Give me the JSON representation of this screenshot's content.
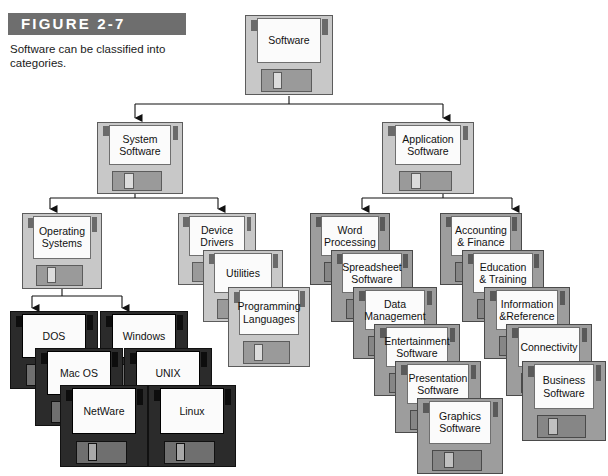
{
  "figure": {
    "header_label": "FIGURE 2-7",
    "caption": "Software can be classified into categories.",
    "header_color": "#6e6e6e"
  },
  "diagram": {
    "root": {
      "label": "Software",
      "style": "light"
    },
    "level2": [
      {
        "label": "System\nSoftware",
        "style": "light"
      },
      {
        "label": "Application\nSoftware",
        "style": "light"
      }
    ],
    "system_children": [
      {
        "label": "Operating\nSystems",
        "style": "light"
      },
      {
        "label": "Device\nDrivers",
        "style": "light"
      },
      {
        "label": "Utilities",
        "style": "light"
      },
      {
        "label": "Programming\nLanguages",
        "style": "light"
      }
    ],
    "operating_systems": {
      "left_stack": [
        {
          "label": "DOS",
          "style": "dark"
        },
        {
          "label": "Mac OS",
          "style": "dark"
        },
        {
          "label": "NetWare",
          "style": "dark"
        }
      ],
      "right_stack": [
        {
          "label": "Windows",
          "style": "dark"
        },
        {
          "label": "UNIX",
          "style": "dark"
        },
        {
          "label": "Linux",
          "style": "dark"
        }
      ]
    },
    "application_left_stack": [
      {
        "label": "Word\nProcessing",
        "style": "gray"
      },
      {
        "label": "Spreadsheet\nSoftware",
        "style": "gray"
      },
      {
        "label": "Data\nManagement",
        "style": "gray"
      },
      {
        "label": "Entertainment\nSoftware",
        "style": "gray"
      },
      {
        "label": "Presentation\nSoftware",
        "style": "gray"
      },
      {
        "label": "Graphics\nSoftware",
        "style": "gray"
      }
    ],
    "application_right_stack": [
      {
        "label": "Accounting\n& Finance",
        "style": "gray"
      },
      {
        "label": "Education\n& Training",
        "style": "gray"
      },
      {
        "label": "Information\n&Reference",
        "style": "gray"
      },
      {
        "label": "Connectivity",
        "style": "gray"
      },
      {
        "label": "Business\nSoftware",
        "style": "gray"
      }
    ]
  },
  "labels": {
    "root": "Software",
    "system_software": "System Software",
    "application_software": "Application Software",
    "operating_systems": "Operating Systems",
    "device_drivers": "Device Drivers",
    "utilities": "Utilities",
    "programming_languages": "Programming Languages",
    "dos": "DOS",
    "mac_os": "Mac OS",
    "netware": "NetWare",
    "windows": "Windows",
    "unix": "UNIX",
    "linux": "Linux",
    "word_processing": "Word Processing",
    "spreadsheet_software": "Spreadsheet Software",
    "data_management": "Data Management",
    "entertainment_software": "Entertainment Software",
    "presentation_software": "Presentation Software",
    "graphics_software": "Graphics Software",
    "accounting_finance": "Accounting & Finance",
    "education_training": "Education & Training",
    "information_reference": "Information &Reference",
    "connectivity": "Connectivity",
    "business_software": "Business Software"
  }
}
